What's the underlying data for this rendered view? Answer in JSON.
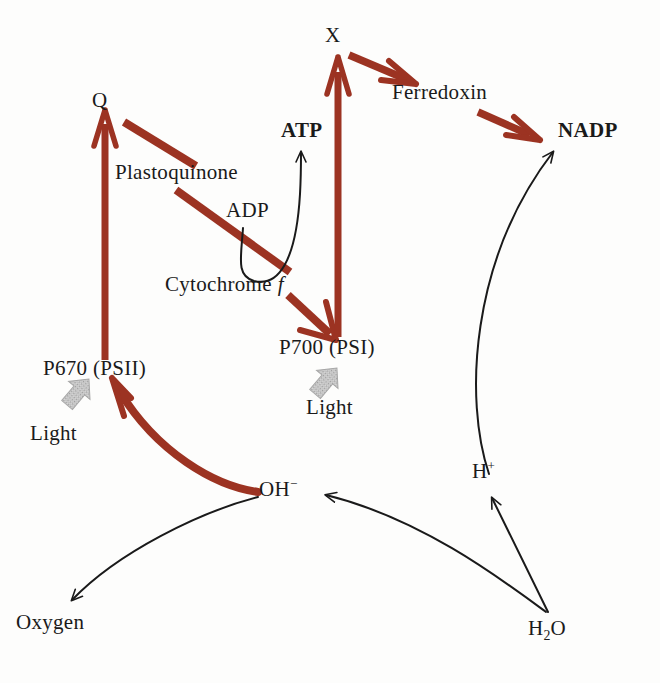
{
  "diagram": {
    "background_color": "#fdfdfc",
    "accent_red": "#9c3322",
    "black": "#1a1a1a",
    "grey_light": "#b9b9b9"
  },
  "labels": {
    "x": "X",
    "q": "Q",
    "ferredoxin": "Ferredoxin",
    "atp": "ATP",
    "nadp": "NADP",
    "plastoquinone": "Plastoquinone",
    "adp": "ADP",
    "cytochrome": "Cytochrome",
    "cytochrome_italic": "f",
    "p700": "P700 (PSI)",
    "p670": "P670 (PSII)",
    "light_psi": "Light",
    "light_psii": "Light",
    "oh_base": "OH",
    "oh_charge": "−",
    "h_base": "H",
    "h_charge": "+",
    "oxygen": "Oxygen",
    "h2o_h": "H",
    "h2o_2": "2",
    "h2o_o": "O"
  },
  "nodes": [
    {
      "id": "p670",
      "label": "P670 (PSII)",
      "kind": "photosystem"
    },
    {
      "id": "q",
      "label": "Q",
      "kind": "carrier"
    },
    {
      "id": "plasto",
      "label": "Plastoquinone",
      "kind": "carrier"
    },
    {
      "id": "cyt",
      "label": "Cytochrome f",
      "kind": "carrier"
    },
    {
      "id": "p700",
      "label": "P700 (PSI)",
      "kind": "photosystem"
    },
    {
      "id": "x",
      "label": "X",
      "kind": "carrier"
    },
    {
      "id": "ferredoxin",
      "label": "Ferredoxin",
      "kind": "carrier"
    },
    {
      "id": "nadp",
      "label": "NADP",
      "kind": "product"
    },
    {
      "id": "adp",
      "label": "ADP",
      "kind": "substrate"
    },
    {
      "id": "atp",
      "label": "ATP",
      "kind": "product"
    },
    {
      "id": "oh",
      "label": "OH−",
      "kind": "ion"
    },
    {
      "id": "hplus",
      "label": "H+",
      "kind": "ion"
    },
    {
      "id": "h2o",
      "label": "H2O",
      "kind": "substrate"
    },
    {
      "id": "oxygen",
      "label": "Oxygen",
      "kind": "product"
    }
  ],
  "edges": [
    {
      "from": "p670",
      "to": "q",
      "style": "thick-red-arrow"
    },
    {
      "from": "q",
      "to": "plasto",
      "style": "thick-red-line"
    },
    {
      "from": "plasto",
      "to": "cyt",
      "style": "thick-red-line"
    },
    {
      "from": "cyt",
      "to": "p700",
      "style": "thick-red-arrow"
    },
    {
      "from": "p700",
      "to": "x",
      "style": "thick-red-arrow"
    },
    {
      "from": "x",
      "to": "ferredoxin",
      "style": "thick-red-arrow"
    },
    {
      "from": "ferredoxin",
      "to": "nadp",
      "style": "thick-red-arrow"
    },
    {
      "from": "adp",
      "to": "atp",
      "style": "thin-black-curve"
    },
    {
      "from": "oh",
      "to": "p670",
      "style": "thick-red-curve"
    },
    {
      "from": "oh",
      "to": "oxygen",
      "style": "thin-black-curve"
    },
    {
      "from": "h2o",
      "to": "oh",
      "style": "thin-black-curve"
    },
    {
      "from": "h2o",
      "to": "hplus",
      "style": "thin-black-arrow"
    },
    {
      "from": "hplus",
      "to": "nadp",
      "style": "thin-black-curve"
    }
  ],
  "light_arrows": [
    {
      "id": "light-arrow-psii",
      "label": "Light",
      "target": "p670"
    },
    {
      "id": "light-arrow-psi",
      "label": "Light",
      "target": "p700"
    }
  ]
}
